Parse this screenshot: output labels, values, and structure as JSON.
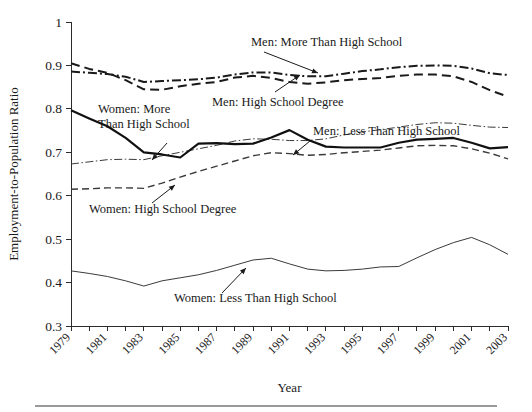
{
  "figure": {
    "type": "line-chart-figure",
    "background": "#ffffff",
    "ink_color": "#1a1a1a",
    "rule_color": "#9a9a9a"
  },
  "chart_data": {
    "type": "line",
    "title": "",
    "xlabel": "Year",
    "ylabel": "Employment-to-Population Ratio",
    "xlim": [
      1979,
      2003
    ],
    "ylim": [
      0.3,
      1.0
    ],
    "ytick_labels": [
      "1",
      "0.9",
      "0.8",
      "0.7",
      "0.6",
      "0.5",
      "0.4",
      "0.3"
    ],
    "ytick_values": [
      1.0,
      0.9,
      0.8,
      0.7,
      0.6,
      0.5,
      0.4,
      0.3
    ],
    "xtick_values": [
      1979,
      1980,
      1981,
      1982,
      1983,
      1984,
      1985,
      1986,
      1987,
      1988,
      1989,
      1990,
      1991,
      1992,
      1993,
      1994,
      1995,
      1996,
      1997,
      1998,
      1999,
      2000,
      2001,
      2002,
      2003
    ],
    "xtick_labels": [
      "1979",
      "1981",
      "1983",
      "1985",
      "1987",
      "1989",
      "1991",
      "1993",
      "1995",
      "1997",
      "1999",
      "2001",
      "2003"
    ],
    "xtick_label_values": [
      1979,
      1981,
      1983,
      1985,
      1987,
      1989,
      1991,
      1993,
      1995,
      1997,
      1999,
      2001,
      2003
    ],
    "grid": false,
    "legend_position": "inline-annotations",
    "x": [
      1979,
      1980,
      1981,
      1982,
      1983,
      1984,
      1985,
      1986,
      1987,
      1988,
      1989,
      1990,
      1991,
      1992,
      1993,
      1994,
      1995,
      1996,
      1997,
      1998,
      1999,
      2000,
      2001,
      2002,
      2003
    ],
    "series": [
      {
        "name": "Men: More Than High School",
        "style": "dash-dot-thick",
        "stroke_width": 2.0,
        "dash": "9,3,2,3",
        "color": "#1a1a1a",
        "values": [
          0.886,
          0.883,
          0.88,
          0.874,
          0.862,
          0.864,
          0.866,
          0.868,
          0.872,
          0.879,
          0.884,
          0.884,
          0.878,
          0.875,
          0.875,
          0.881,
          0.887,
          0.891,
          0.896,
          0.899,
          0.9,
          0.899,
          0.893,
          0.882,
          0.878
        ]
      },
      {
        "name": "Men: High School Degree",
        "style": "dashed-thick",
        "stroke_width": 2.0,
        "dash": "9,5",
        "color": "#1a1a1a",
        "values": [
          0.905,
          0.892,
          0.883,
          0.866,
          0.845,
          0.844,
          0.852,
          0.858,
          0.862,
          0.872,
          0.876,
          0.871,
          0.862,
          0.858,
          0.861,
          0.866,
          0.869,
          0.871,
          0.876,
          0.879,
          0.879,
          0.875,
          0.862,
          0.843,
          0.828
        ]
      },
      {
        "name": "Men: Less Than High School",
        "style": "dash-dot-thin",
        "stroke_width": 1.0,
        "dash": "8,2.5,1.5,2.5",
        "color": "#3a3a3a",
        "values": [
          0.673,
          0.678,
          0.683,
          0.684,
          0.683,
          0.692,
          0.7,
          0.708,
          0.716,
          0.726,
          0.731,
          0.73,
          0.727,
          0.727,
          0.731,
          0.74,
          0.747,
          0.752,
          0.758,
          0.764,
          0.768,
          0.767,
          0.762,
          0.758,
          0.757
        ]
      },
      {
        "name": "Women: More Than High School",
        "style": "solid-thick",
        "stroke_width": 2.2,
        "dash": "none",
        "color": "#111111",
        "values": [
          0.797,
          0.778,
          0.76,
          0.733,
          0.7,
          0.695,
          0.688,
          0.72,
          0.721,
          0.719,
          0.72,
          0.734,
          0.751,
          0.729,
          0.713,
          0.711,
          0.711,
          0.711,
          0.722,
          0.729,
          0.731,
          0.733,
          0.722,
          0.709,
          0.712
        ]
      },
      {
        "name": "Women: High School Degree",
        "style": "dashed-thin",
        "stroke_width": 1.4,
        "dash": "7,4",
        "color": "#3a3a3a",
        "values": [
          0.615,
          0.616,
          0.618,
          0.618,
          0.617,
          0.629,
          0.643,
          0.656,
          0.668,
          0.68,
          0.692,
          0.699,
          0.697,
          0.693,
          0.695,
          0.699,
          0.702,
          0.705,
          0.71,
          0.715,
          0.716,
          0.715,
          0.708,
          0.698,
          0.685
        ]
      },
      {
        "name": "Women: Less Than High School",
        "style": "solid-thin",
        "stroke_width": 1.0,
        "dash": "none",
        "color": "#3a3a3a",
        "values": [
          0.427,
          0.421,
          0.414,
          0.404,
          0.392,
          0.404,
          0.411,
          0.418,
          0.428,
          0.44,
          0.452,
          0.456,
          0.443,
          0.431,
          0.427,
          0.428,
          0.431,
          0.436,
          0.437,
          0.457,
          0.476,
          0.492,
          0.504,
          0.487,
          0.465
        ]
      }
    ],
    "annotations": [
      {
        "id": "men-more-than-high-school",
        "lines": [
          "Men: More Than High School"
        ],
        "text_x": 251,
        "text_y": 46,
        "anchor": "start",
        "leader_from": [
          264,
          52
        ],
        "leader_to": [
          318,
          73
        ]
      },
      {
        "id": "women-more-than-high-school",
        "lines": [
          "Women: More",
          "Than High School"
        ],
        "text_x": 98,
        "text_y": 113,
        "anchor": "start",
        "leader_from": [
          167,
          143
        ],
        "leader_to": [
          152,
          160
        ]
      },
      {
        "id": "men-high-school-degree",
        "lines": [
          "Men: High School Degree"
        ],
        "text_x": 212,
        "text_y": 106,
        "anchor": "start",
        "leader_from": [
          275,
          92
        ],
        "leader_to": [
          300,
          75
        ]
      },
      {
        "id": "men-less-than-high-school",
        "lines": [
          "Men: Less Than High School"
        ],
        "text_x": 313,
        "text_y": 135,
        "anchor": "start",
        "leader_from": [
          310,
          141
        ],
        "leader_to": [
          293,
          155
        ]
      },
      {
        "id": "women-high-school-degree",
        "lines": [
          "Women: High School Degree"
        ],
        "text_x": 89,
        "text_y": 213,
        "anchor": "start",
        "leader_from": [
          152,
          203
        ],
        "leader_to": [
          175,
          185
        ]
      },
      {
        "id": "women-less-than-high-school",
        "lines": [
          "Women: Less Than High School"
        ],
        "text_x": 174,
        "text_y": 302,
        "anchor": "start",
        "leader_from": [
          222,
          293
        ],
        "leader_to": [
          246,
          268
        ]
      }
    ]
  }
}
